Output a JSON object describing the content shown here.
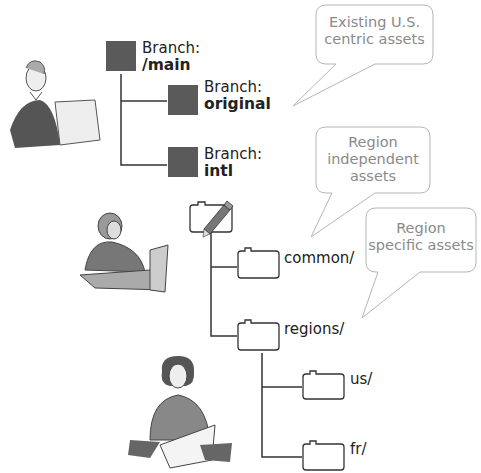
{
  "branches": [
    {
      "prefix": "Branch:",
      "name": "/main"
    },
    {
      "prefix": "Branch:",
      "name": "original"
    },
    {
      "prefix": "Branch:",
      "name": "intl"
    }
  ],
  "folders": {
    "root": {
      "label": "",
      "icon": "pencil-folder"
    },
    "common": {
      "label": "common/"
    },
    "regions": {
      "label": "regions/"
    },
    "us": {
      "label": "us/"
    },
    "fr": {
      "label": "fr/"
    }
  },
  "callouts": [
    {
      "text_line1": "Existing U.S.",
      "text_line2": "centric assets"
    },
    {
      "text_line1": "Region",
      "text_line2": "independent",
      "text_line3": "assets"
    },
    {
      "text_line1": "Region",
      "text_line2": "specific assets"
    }
  ],
  "figures": [
    {
      "name": "woman-at-computer-1"
    },
    {
      "name": "woman-at-computer-2"
    },
    {
      "name": "woman-with-papers"
    }
  ],
  "colors": {
    "branch_box": "#5a5a5a",
    "line": "#333333",
    "callout_border": "#b5b5b5",
    "callout_text": "#8a8a8a"
  }
}
